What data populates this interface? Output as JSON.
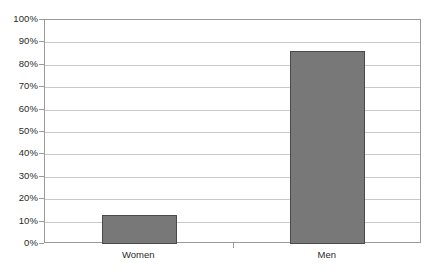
{
  "chart_data": {
    "type": "bar",
    "title": "",
    "subtitle": "",
    "xlabel": "",
    "ylabel": "",
    "categories": [
      "Women",
      "Men"
    ],
    "values": [
      13,
      86
    ],
    "value_labels": [
      "",
      ""
    ],
    "ylim": [
      0,
      100
    ],
    "ytick_labels": [
      "0%",
      "10%",
      "20%",
      "30%",
      "40%",
      "50%",
      "60%",
      "70%",
      "80%",
      "90%",
      "100%"
    ],
    "ytick_values": [
      0,
      10,
      20,
      30,
      40,
      50,
      60,
      70,
      80,
      90,
      100
    ],
    "grid": true,
    "grid_axis": "y",
    "legend": false,
    "legend_position": "none",
    "series": [
      {
        "name": "",
        "values": [
          13,
          86
        ]
      }
    ]
  },
  "style": {
    "bar_fill": "#787878",
    "bar_border": "#4a4a4a",
    "grid_color": "#c9c9c9",
    "axis_color": "#9a9a9a",
    "text_color": "#2b2b2b",
    "background": "#ffffff"
  },
  "axes": {
    "y": {
      "ticks": [
        {
          "label": "100%",
          "value": 100
        },
        {
          "label": "90%",
          "value": 90
        },
        {
          "label": "80%",
          "value": 80
        },
        {
          "label": "70%",
          "value": 70
        },
        {
          "label": "60%",
          "value": 60
        },
        {
          "label": "50%",
          "value": 50
        },
        {
          "label": "40%",
          "value": 40
        },
        {
          "label": "30%",
          "value": 30
        },
        {
          "label": "20%",
          "value": 20
        },
        {
          "label": "10%",
          "value": 10
        },
        {
          "label": "0%",
          "value": 0
        }
      ]
    },
    "x": {
      "ticks": [
        {
          "label": "Women"
        },
        {
          "label": "Men"
        }
      ]
    }
  }
}
